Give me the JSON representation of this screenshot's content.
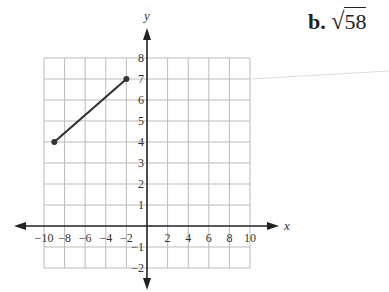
{
  "answer": {
    "label": "b.",
    "value": "58",
    "expression": "√58"
  },
  "chart_data": {
    "type": "line",
    "title": "",
    "xlabel": "x",
    "ylabel": "y",
    "xlim": [
      -10,
      10
    ],
    "ylim": [
      -2,
      8
    ],
    "grid": true,
    "x_ticks": [
      -10,
      -8,
      -6,
      -4,
      -2,
      2,
      4,
      6,
      8,
      10
    ],
    "y_ticks": [
      -2,
      -1,
      1,
      2,
      3,
      4,
      5,
      6,
      7,
      8
    ],
    "series": [
      {
        "name": "segment",
        "points": [
          [
            -9,
            4
          ],
          [
            -2,
            7
          ]
        ]
      }
    ]
  }
}
